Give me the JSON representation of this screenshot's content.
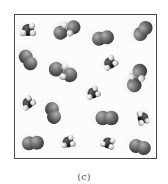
{
  "figure": {
    "caption": "(c)",
    "box": {
      "x": 14,
      "y": 14,
      "width": 141,
      "height": 143,
      "border_color": "#4a4a4a"
    },
    "colors": {
      "large_atom": "#6e6e6e",
      "large_atom_highlight": "#a8a8a8",
      "dark_atom": "#2b2b2b",
      "small_atom": "#d9d9d9",
      "small_atom_highlight": "#f5f5f5",
      "motion_blur": "#d6d6d6"
    },
    "molecules": [
      {
        "id": "m1",
        "type": "dark-hydride",
        "x": 28,
        "y": 30,
        "angle": 0,
        "scale": 1.0
      },
      {
        "id": "m2",
        "type": "large-pair-h",
        "x": 67,
        "y": 30,
        "angle": -15,
        "scale": 1.0
      },
      {
        "id": "m3",
        "type": "diatomic",
        "x": 103,
        "y": 38,
        "angle": -10,
        "scale": 1.0
      },
      {
        "id": "m4",
        "type": "diatomic",
        "x": 143,
        "y": 31,
        "angle": -50,
        "scale": 1.0
      },
      {
        "id": "m5",
        "type": "diatomic",
        "x": 28,
        "y": 60,
        "angle": 55,
        "scale": 1.0
      },
      {
        "id": "m6",
        "type": "large-pair-h",
        "x": 63,
        "y": 72,
        "angle": 30,
        "scale": 1.05
      },
      {
        "id": "m7",
        "type": "dark-hydride",
        "x": 110,
        "y": 63,
        "angle": -30,
        "scale": 0.95
      },
      {
        "id": "m8",
        "type": "large-pair-h",
        "x": 137,
        "y": 78,
        "angle": -60,
        "scale": 1.05
      },
      {
        "id": "m9",
        "type": "dark-hydride",
        "x": 93,
        "y": 93,
        "angle": -20,
        "scale": 0.9
      },
      {
        "id": "m10",
        "type": "dark-hydride",
        "x": 28,
        "y": 103,
        "angle": -35,
        "scale": 0.9
      },
      {
        "id": "m11",
        "type": "diatomic",
        "x": 53,
        "y": 113,
        "angle": 75,
        "scale": 1.0
      },
      {
        "id": "m12",
        "type": "diatomic",
        "x": 107,
        "y": 118,
        "angle": 0,
        "scale": 1.05
      },
      {
        "id": "m13",
        "type": "dark-hydride",
        "x": 143,
        "y": 118,
        "angle": 80,
        "scale": 0.9
      },
      {
        "id": "m14",
        "type": "diatomic",
        "x": 33,
        "y": 143,
        "angle": -5,
        "scale": 1.0
      },
      {
        "id": "m15",
        "type": "dark-hydride",
        "x": 68,
        "y": 142,
        "angle": -10,
        "scale": 0.9
      },
      {
        "id": "m16",
        "type": "dark-hydride",
        "x": 108,
        "y": 143,
        "angle": 20,
        "scale": 0.9
      },
      {
        "id": "m17",
        "type": "diatomic",
        "x": 140,
        "y": 147,
        "angle": 15,
        "scale": 1.0
      }
    ]
  }
}
